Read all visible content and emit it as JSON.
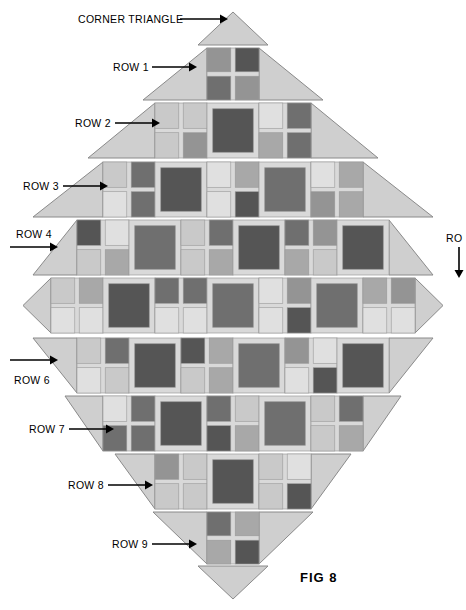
{
  "figure": {
    "caption": "FIG  8",
    "caption_x": 300,
    "caption_y": 570,
    "background": "#ffffff"
  },
  "palette": {
    "triangle_fill": "#cfcfcf",
    "triangle_stroke": "#8a8a8a",
    "sashing": "#d9d9d9",
    "block_outline": "#9a9a9a",
    "tone_light": "#e0e0e0",
    "tone_light2": "#c9c9c9",
    "tone_mid": "#a8a8a8",
    "tone_mid2": "#949494",
    "tone_dark": "#6f6f6f",
    "tone_darker": "#555555",
    "arrow": "#000000",
    "text": "#000000"
  },
  "labels": [
    {
      "name": "corner-triangle-top",
      "text": "CORNER TRIANGLE",
      "x": 78,
      "y": 14,
      "arrow": {
        "x1": 180,
        "y1": 19,
        "x2": 228,
        "y2": 19,
        "dir": "right"
      }
    },
    {
      "name": "row-1",
      "text": "ROW 1",
      "x": 113,
      "y": 62,
      "arrow": {
        "x1": 152,
        "y1": 67,
        "x2": 197,
        "y2": 67,
        "dir": "right"
      }
    },
    {
      "name": "row-2",
      "text": "ROW 2",
      "x": 75,
      "y": 118,
      "arrow": {
        "x1": 115,
        "y1": 123,
        "x2": 160,
        "y2": 123,
        "dir": "right"
      }
    },
    {
      "name": "row-3",
      "text": "ROW 3",
      "x": 23,
      "y": 181,
      "arrow": {
        "x1": 63,
        "y1": 186,
        "x2": 108,
        "y2": 186,
        "dir": "right"
      }
    },
    {
      "name": "row-4",
      "text": "ROW 4",
      "x": 16,
      "y": 229,
      "arrow": {
        "x1": 10,
        "y1": 247,
        "x2": 58,
        "y2": 247,
        "dir": "right"
      }
    },
    {
      "name": "row-5",
      "text": "RO",
      "x": 446,
      "y": 233,
      "arrow": {
        "x1": 459,
        "y1": 247,
        "x2": 459,
        "y2": 278,
        "dir": "down"
      }
    },
    {
      "name": "row-6",
      "text": "ROW 6",
      "x": 14,
      "y": 375,
      "arrow": {
        "x1": 10,
        "y1": 360,
        "x2": 58,
        "y2": 360,
        "dir": "right"
      }
    },
    {
      "name": "row-7",
      "text": "ROW 7",
      "x": 29,
      "y": 424,
      "arrow": {
        "x1": 69,
        "y1": 429,
        "x2": 114,
        "y2": 429,
        "dir": "right"
      }
    },
    {
      "name": "row-8",
      "text": "ROW 8",
      "x": 68,
      "y": 480,
      "arrow": {
        "x1": 108,
        "y1": 485,
        "x2": 153,
        "y2": 485,
        "dir": "right"
      }
    },
    {
      "name": "row-9",
      "text": "ROW 9",
      "x": 112,
      "y": 539,
      "arrow": {
        "x1": 152,
        "y1": 544,
        "x2": 197,
        "y2": 544,
        "dir": "right"
      }
    }
  ],
  "quilt": {
    "center_x": 233,
    "row_height": 56,
    "rows": [
      {
        "name": "corner-triangle-top",
        "kind": "corner",
        "y": 12,
        "h": 33,
        "half_w": 35,
        "point": "up",
        "blocks": 0
      },
      {
        "name": "row-1",
        "kind": "row",
        "y": 48,
        "h": 52,
        "half_w": 90,
        "point": "up",
        "blocks": 1,
        "block_w": 52,
        "pattern": [
          "fourpatch"
        ]
      },
      {
        "name": "row-2",
        "kind": "row",
        "y": 103,
        "h": 55,
        "half_w": 145,
        "point": "up",
        "blocks": 3,
        "block_w": 52,
        "pattern": [
          "fourpatch",
          "framed",
          "fourpatch"
        ]
      },
      {
        "name": "row-3",
        "kind": "row",
        "y": 162,
        "h": 55,
        "half_w": 200,
        "point": "up",
        "blocks": 5,
        "block_w": 52,
        "pattern": [
          "fourpatch",
          "framed",
          "fourpatch",
          "framed",
          "fourpatch"
        ]
      },
      {
        "name": "row-4",
        "kind": "row",
        "y": 220,
        "h": 55,
        "half_w": 200,
        "point": "up",
        "blocks": 6,
        "block_w": 52,
        "pattern": [
          "fourpatch",
          "framed",
          "fourpatch",
          "framed",
          "fourpatch",
          "framed"
        ]
      },
      {
        "name": "row-5",
        "kind": "row",
        "y": 278,
        "h": 55,
        "half_w": 200,
        "point": "side",
        "blocks": 7,
        "block_w": 52,
        "pattern": [
          "fourpatch",
          "framed",
          "fourpatch",
          "framed",
          "fourpatch",
          "framed",
          "fourpatch"
        ]
      },
      {
        "name": "row-6",
        "kind": "row",
        "y": 338,
        "h": 55,
        "half_w": 200,
        "point": "down",
        "blocks": 6,
        "block_w": 52,
        "pattern": [
          "fourpatch",
          "framed",
          "fourpatch",
          "framed",
          "fourpatch",
          "framed"
        ]
      },
      {
        "name": "row-7",
        "kind": "row",
        "y": 396,
        "h": 55,
        "half_w": 168,
        "point": "down",
        "blocks": 5,
        "block_w": 52,
        "pattern": [
          "fourpatch",
          "framed",
          "fourpatch",
          "framed",
          "fourpatch"
        ]
      },
      {
        "name": "row-8",
        "kind": "row",
        "y": 454,
        "h": 55,
        "half_w": 118,
        "point": "down",
        "blocks": 3,
        "block_w": 52,
        "pattern": [
          "fourpatch",
          "framed",
          "fourpatch"
        ]
      },
      {
        "name": "row-9",
        "kind": "row",
        "y": 512,
        "h": 52,
        "half_w": 80,
        "point": "down",
        "blocks": 1,
        "block_w": 52,
        "pattern": [
          "fourpatch"
        ]
      },
      {
        "name": "corner-triangle-bottom",
        "kind": "corner",
        "y": 566,
        "h": 33,
        "half_w": 35,
        "point": "down",
        "blocks": 0
      }
    ]
  }
}
